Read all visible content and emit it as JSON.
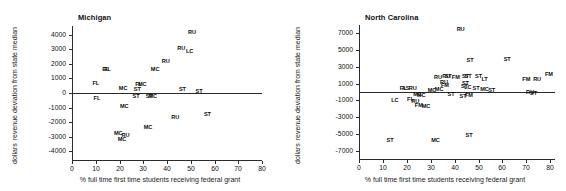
{
  "figure": {
    "width": 566,
    "height": 191,
    "background": "#ffffff",
    "ink_color": "#1a1a1a"
  },
  "chart_data": [
    {
      "type": "scatter",
      "title": "Michigan",
      "xlabel": "% full time first time students receiving federal grant",
      "ylabel": "revenue deviation from state median",
      "ylabel_units": "dollars",
      "xlim": [
        0,
        80
      ],
      "ylim": [
        -4600,
        4600
      ],
      "xticks": [
        0,
        10,
        20,
        30,
        40,
        50,
        60,
        70,
        80
      ],
      "xticklabels": [
        "0",
        "10",
        "20",
        "30",
        "40",
        "50",
        "60",
        "70",
        "80"
      ],
      "yticks": [
        -4000,
        -3000,
        -2000,
        -1000,
        0,
        1000,
        2000,
        3000,
        4000
      ],
      "yticklabels": [
        "-4000",
        "-3000",
        "-2000",
        "-1000",
        "0",
        "1000",
        "2000",
        "3000",
        "4000"
      ],
      "grid": false,
      "legend": "none",
      "marker_style": "text-label",
      "zero_reference_line": 0,
      "points": [
        {
          "label": "RU",
          "x": 50.5,
          "y": 4150
        },
        {
          "label": "RU",
          "x": 46.0,
          "y": 3050
        },
        {
          "label": "LC",
          "x": 49.5,
          "y": 2800
        },
        {
          "label": "RU",
          "x": 39.5,
          "y": 2150
        },
        {
          "label": "MC",
          "x": 35.0,
          "y": 1600
        },
        {
          "label": "FL",
          "x": 15.0,
          "y": 1600
        },
        {
          "label": "EL",
          "x": 14.2,
          "y": 1580
        },
        {
          "label": "FL",
          "x": 10.0,
          "y": 600
        },
        {
          "label": "FL",
          "x": 28.0,
          "y": 560
        },
        {
          "label": "MC",
          "x": 29.6,
          "y": 560
        },
        {
          "label": "MC",
          "x": 21.5,
          "y": 250
        },
        {
          "label": "ST",
          "x": 27.5,
          "y": 230
        },
        {
          "label": "ST",
          "x": 46.5,
          "y": 190
        },
        {
          "label": "ST",
          "x": 53.5,
          "y": 40
        },
        {
          "label": "ST",
          "x": 27.0,
          "y": -260
        },
        {
          "label": "ST",
          "x": 32.5,
          "y": -270
        },
        {
          "label": "MC",
          "x": 34.0,
          "y": -280
        },
        {
          "label": "FL",
          "x": 10.5,
          "y": -420
        },
        {
          "label": "MC",
          "x": 22.0,
          "y": -960
        },
        {
          "label": "RU",
          "x": 43.5,
          "y": -1720
        },
        {
          "label": "ST",
          "x": 57.0,
          "y": -1480
        },
        {
          "label": "MC",
          "x": 32.0,
          "y": -2380
        },
        {
          "label": "MC",
          "x": 19.5,
          "y": -2820
        },
        {
          "label": "RU",
          "x": 22.5,
          "y": -2980
        },
        {
          "label": "MC",
          "x": 21.0,
          "y": -3250
        }
      ]
    },
    {
      "type": "scatter",
      "title": "North Carolina",
      "xlabel": "% full time first time students receiving federal grant",
      "ylabel": "revenue deviation from state median",
      "ylabel_units": "dollars",
      "xlim": [
        0,
        82
      ],
      "ylim": [
        -8000,
        8000
      ],
      "xticks": [
        0,
        10,
        20,
        30,
        40,
        50,
        60,
        70,
        80
      ],
      "xticklabels": [
        "0",
        "10",
        "20",
        "30",
        "40",
        "50",
        "60",
        "70",
        "80"
      ],
      "yticks": [
        -7000,
        -5000,
        -3000,
        -1000,
        1000,
        3000,
        5000,
        7000
      ],
      "yticklabels": [
        "-7000",
        "-5000",
        "-3000",
        "-1000",
        "1000",
        "3000",
        "5000",
        "7000"
      ],
      "grid": false,
      "legend": "none",
      "marker_style": "text-label",
      "zero_reference_line": 0,
      "points": [
        {
          "label": "RU",
          "x": 42.5,
          "y": 7450
        },
        {
          "label": "ST",
          "x": 46.5,
          "y": 3700
        },
        {
          "label": "ST",
          "x": 62.0,
          "y": 3800
        },
        {
          "label": "RU",
          "x": 33.0,
          "y": 1700
        },
        {
          "label": "RU",
          "x": 36.5,
          "y": 1780
        },
        {
          "label": "ST",
          "x": 37.3,
          "y": 1780
        },
        {
          "label": "FM",
          "x": 40.5,
          "y": 1700
        },
        {
          "label": "ST",
          "x": 44.5,
          "y": 1850
        },
        {
          "label": "ST",
          "x": 45.6,
          "y": 1820
        },
        {
          "label": "ST",
          "x": 50.0,
          "y": 1750
        },
        {
          "label": "LT",
          "x": 52.5,
          "y": 1400
        },
        {
          "label": "FM",
          "x": 70.0,
          "y": 1450
        },
        {
          "label": "RU",
          "x": 74.5,
          "y": 1400
        },
        {
          "label": "FM",
          "x": 79.5,
          "y": 2000
        },
        {
          "label": "RU",
          "x": 35.5,
          "y": 1100
        },
        {
          "label": "ST",
          "x": 44.5,
          "y": 1000
        },
        {
          "label": "FM",
          "x": 36.0,
          "y": 700
        },
        {
          "label": "ST",
          "x": 44.2,
          "y": 560
        },
        {
          "label": "LC",
          "x": 45.5,
          "y": 480
        },
        {
          "label": "RU",
          "x": 22.5,
          "y": 420
        },
        {
          "label": "FL",
          "x": 18.5,
          "y": 320
        },
        {
          "label": "AS",
          "x": 19.5,
          "y": 330
        },
        {
          "label": "MC",
          "x": 33.5,
          "y": 260
        },
        {
          "label": "MC",
          "x": 30.5,
          "y": 130
        },
        {
          "label": "ST",
          "x": 49.0,
          "y": 330
        },
        {
          "label": "MC",
          "x": 52.5,
          "y": 200
        },
        {
          "label": "ST",
          "x": 55.5,
          "y": 170
        },
        {
          "label": "ST",
          "x": 38.5,
          "y": -300
        },
        {
          "label": "MC",
          "x": 24.5,
          "y": -400
        },
        {
          "label": "MC",
          "x": 26.0,
          "y": -430
        },
        {
          "label": "ST",
          "x": 43.5,
          "y": -600
        },
        {
          "label": "FM",
          "x": 46.0,
          "y": -500
        },
        {
          "label": "RU",
          "x": 71.5,
          "y": -120
        },
        {
          "label": "ST",
          "x": 73.0,
          "y": -200
        },
        {
          "label": "LC",
          "x": 15.0,
          "y": -1050
        },
        {
          "label": "FL",
          "x": 21.5,
          "y": -1000
        },
        {
          "label": "RU",
          "x": 23.5,
          "y": -1200
        },
        {
          "label": "FM",
          "x": 25.0,
          "y": -1650
        },
        {
          "label": "MC",
          "x": 28.0,
          "y": -1800
        },
        {
          "label": "ST",
          "x": 13.0,
          "y": -5800
        },
        {
          "label": "MC",
          "x": 32.0,
          "y": -5800
        },
        {
          "label": "ST",
          "x": 46.0,
          "y": -5200
        }
      ]
    }
  ]
}
